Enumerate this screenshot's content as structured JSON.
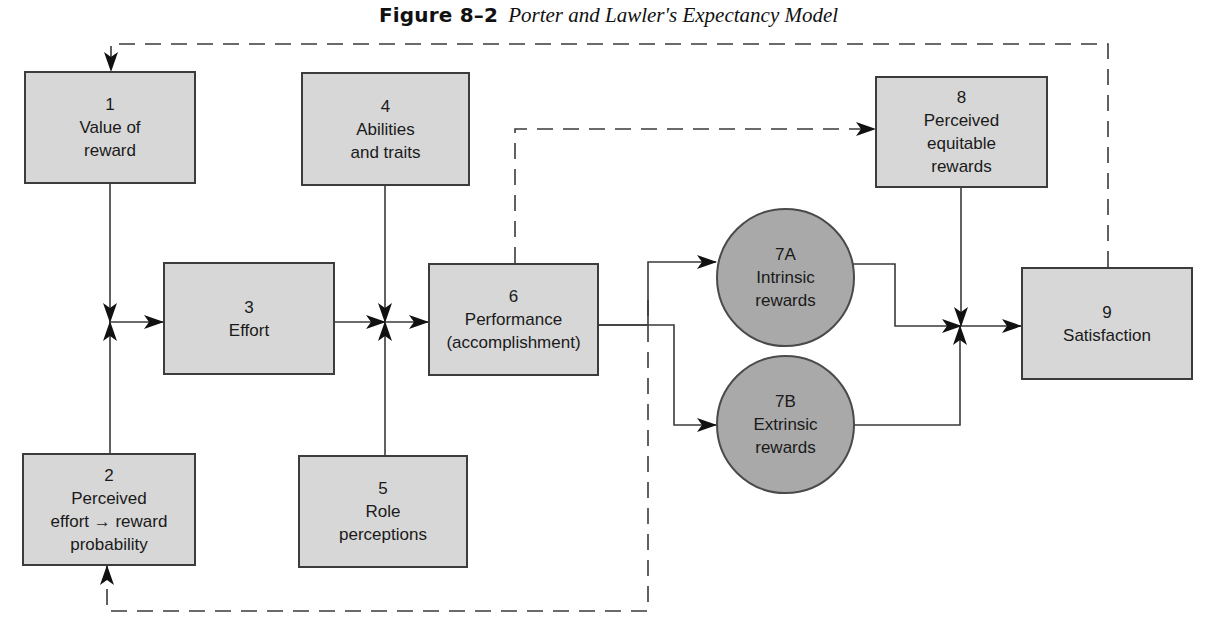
{
  "title": {
    "figure_label": "Figure 8–2",
    "caption": "Porter and Lawler's Expectancy Model"
  },
  "colors": {
    "box_fill": "#d7d7d7",
    "circle_fill": "#a9a9a9",
    "stroke": "#3c3c3c",
    "background": "#ffffff"
  },
  "nodes": [
    {
      "id": "1",
      "number": "1",
      "label": "Value of\nreward",
      "shape": "rect"
    },
    {
      "id": "2",
      "number": "2",
      "label": "Perceived\neffort → reward\nprobability",
      "shape": "rect"
    },
    {
      "id": "3",
      "number": "3",
      "label": "Effort",
      "shape": "rect"
    },
    {
      "id": "4",
      "number": "4",
      "label": "Abilities\nand traits",
      "shape": "rect"
    },
    {
      "id": "5",
      "number": "5",
      "label": "Role\nperceptions",
      "shape": "rect"
    },
    {
      "id": "6",
      "number": "6",
      "label": "Performance\n(accomplishment)",
      "shape": "rect"
    },
    {
      "id": "7A",
      "number": "7A",
      "label": "Intrinsic\nrewards",
      "shape": "circle"
    },
    {
      "id": "7B",
      "number": "7B",
      "label": "Extrinsic\nrewards",
      "shape": "circle"
    },
    {
      "id": "8",
      "number": "8",
      "label": "Perceived\nequitable\nrewards",
      "shape": "rect"
    },
    {
      "id": "9",
      "number": "9",
      "label": "Satisfaction",
      "shape": "rect"
    }
  ],
  "edges": [
    {
      "from": "1",
      "to": "junction-a",
      "style": "solid"
    },
    {
      "from": "2",
      "to": "junction-a",
      "style": "solid"
    },
    {
      "from": "junction-a",
      "to": "3",
      "style": "solid"
    },
    {
      "from": "3",
      "to": "junction-b",
      "style": "solid"
    },
    {
      "from": "4",
      "to": "junction-b",
      "style": "solid"
    },
    {
      "from": "5",
      "to": "junction-b",
      "style": "solid"
    },
    {
      "from": "junction-b",
      "to": "6",
      "style": "solid"
    },
    {
      "from": "6",
      "to": "7A",
      "style": "solid"
    },
    {
      "from": "6",
      "to": "7B",
      "style": "solid"
    },
    {
      "from": "6",
      "to": "8",
      "style": "dashed"
    },
    {
      "from": "6",
      "to": "2",
      "style": "dashed"
    },
    {
      "from": "7A",
      "to": "junction-c",
      "style": "solid"
    },
    {
      "from": "7B",
      "to": "junction-c",
      "style": "solid"
    },
    {
      "from": "8",
      "to": "junction-c",
      "style": "solid"
    },
    {
      "from": "junction-c",
      "to": "9",
      "style": "solid"
    },
    {
      "from": "9",
      "to": "1",
      "style": "dashed"
    }
  ]
}
